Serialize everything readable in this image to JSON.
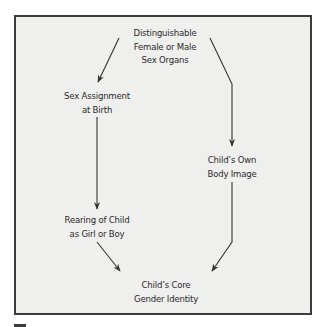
{
  "diagram": {
    "type": "flowchart",
    "colors": {
      "background": "#ffffff",
      "panel_fill": "#efefee",
      "border": "#3c3c3c",
      "text": "#2b2b2b",
      "arrow": "#333333"
    },
    "nodes": [
      {
        "id": "organs",
        "lines": [
          "Distinguishable",
          "Female or Male",
          "Sex Organs"
        ]
      },
      {
        "id": "assignment",
        "lines": [
          "Sex Assignment",
          "at Birth"
        ]
      },
      {
        "id": "body_image",
        "lines": [
          "Child’s Own",
          "Body Image"
        ]
      },
      {
        "id": "rearing",
        "lines": [
          "Rearing of Child",
          "as Girl or Boy"
        ]
      },
      {
        "id": "identity",
        "lines": [
          "Child’s Core",
          "Gender Identity"
        ]
      }
    ],
    "edges": [
      {
        "from": "organs",
        "to": "assignment"
      },
      {
        "from": "organs",
        "to": "body_image"
      },
      {
        "from": "assignment",
        "to": "rearing"
      },
      {
        "from": "rearing",
        "to": "identity"
      },
      {
        "from": "body_image",
        "to": "identity"
      }
    ]
  }
}
